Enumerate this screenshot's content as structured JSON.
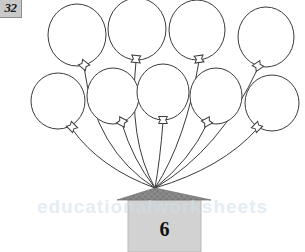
{
  "page": {
    "number_label": "32",
    "background_color": "#ffffff",
    "width": 305,
    "height": 252
  },
  "watermark": {
    "text": "educationalworksheets"
  },
  "worksheet": {
    "type": "counting-balloons-illustration",
    "house": {
      "number_label": "6",
      "body_color": "#d2d2d2",
      "body_outline_color": "#b9b9b9",
      "roof_color": "#8c8c8c",
      "roof_texture_color": "#7a7a7a",
      "body": {
        "x": 128,
        "y": 200,
        "width": 73,
        "height": 52
      },
      "roof": {
        "left_x": 117,
        "right_x": 211,
        "base_y": 200,
        "apex_x": 155,
        "apex_y": 188
      }
    },
    "balloon_style": {
      "outline_color": "#3b3b3b",
      "fill_color": "#ffffff",
      "string_color": "#3b3b3b",
      "outline_width": 1
    },
    "anchor_point": {
      "x": 155,
      "y": 188
    },
    "balloon_count": 9,
    "rows": [
      {
        "row_index": 0,
        "label": "top-row",
        "count": 4,
        "balloons": [
          {
            "id": "balloon-1",
            "cx": 77,
            "cy": 35,
            "rx": 29,
            "ry": 31,
            "knot_x": 84,
            "knot_y": 65,
            "knot_rot": 38
          },
          {
            "id": "balloon-2",
            "cx": 137,
            "cy": 29,
            "rx": 29,
            "ry": 31,
            "knot_x": 136,
            "knot_y": 59,
            "knot_rot": 5
          },
          {
            "id": "balloon-3",
            "cx": 197,
            "cy": 30,
            "rx": 28,
            "ry": 30,
            "knot_x": 199,
            "knot_y": 59,
            "knot_rot": -8
          },
          {
            "id": "balloon-4",
            "cx": 266,
            "cy": 37,
            "rx": 28,
            "ry": 30,
            "knot_x": 258,
            "knot_y": 66,
            "knot_rot": -34
          }
        ]
      },
      {
        "row_index": 1,
        "label": "second-row",
        "count": 5,
        "balloons": [
          {
            "id": "balloon-5",
            "cx": 58,
            "cy": 101,
            "rx": 27,
            "ry": 28,
            "knot_x": 72,
            "knot_y": 127,
            "knot_rot": 46
          },
          {
            "id": "balloon-6",
            "cx": 113,
            "cy": 96,
            "rx": 26,
            "ry": 28,
            "knot_x": 122,
            "knot_y": 122,
            "knot_rot": 28
          },
          {
            "id": "balloon-7",
            "cx": 163,
            "cy": 92,
            "rx": 26,
            "ry": 28,
            "knot_x": 163,
            "knot_y": 120,
            "knot_rot": 0
          },
          {
            "id": "balloon-8",
            "cx": 216,
            "cy": 96,
            "rx": 26,
            "ry": 28,
            "knot_x": 207,
            "knot_y": 122,
            "knot_rot": -28
          },
          {
            "id": "balloon-9",
            "cx": 272,
            "cy": 103,
            "rx": 27,
            "ry": 28,
            "knot_x": 257,
            "knot_y": 127,
            "knot_rot": -46
          }
        ]
      }
    ],
    "strings": [
      {
        "id": "string-1",
        "from_x": 84,
        "from_y": 67,
        "ctrl_x": 95,
        "ctrl_y": 150,
        "to_x": 155,
        "to_y": 188
      },
      {
        "id": "string-2",
        "from_x": 136,
        "from_y": 61,
        "ctrl_x": 128,
        "ctrl_y": 140,
        "to_x": 155,
        "to_y": 188
      },
      {
        "id": "string-3",
        "from_x": 199,
        "from_y": 61,
        "ctrl_x": 186,
        "ctrl_y": 140,
        "to_x": 155,
        "to_y": 188
      },
      {
        "id": "string-4",
        "from_x": 258,
        "from_y": 68,
        "ctrl_x": 220,
        "ctrl_y": 150,
        "to_x": 155,
        "to_y": 188
      },
      {
        "id": "string-5",
        "from_x": 72,
        "from_y": 129,
        "ctrl_x": 100,
        "ctrl_y": 168,
        "to_x": 155,
        "to_y": 188
      },
      {
        "id": "string-6",
        "from_x": 122,
        "from_y": 124,
        "ctrl_x": 133,
        "ctrl_y": 160,
        "to_x": 155,
        "to_y": 188
      },
      {
        "id": "string-7",
        "from_x": 163,
        "from_y": 122,
        "ctrl_x": 160,
        "ctrl_y": 160,
        "to_x": 155,
        "to_y": 188
      },
      {
        "id": "string-8",
        "from_x": 207,
        "from_y": 124,
        "ctrl_x": 190,
        "ctrl_y": 160,
        "to_x": 155,
        "to_y": 188
      },
      {
        "id": "string-9",
        "from_x": 257,
        "from_y": 129,
        "ctrl_x": 222,
        "ctrl_y": 168,
        "to_x": 155,
        "to_y": 188
      }
    ]
  }
}
